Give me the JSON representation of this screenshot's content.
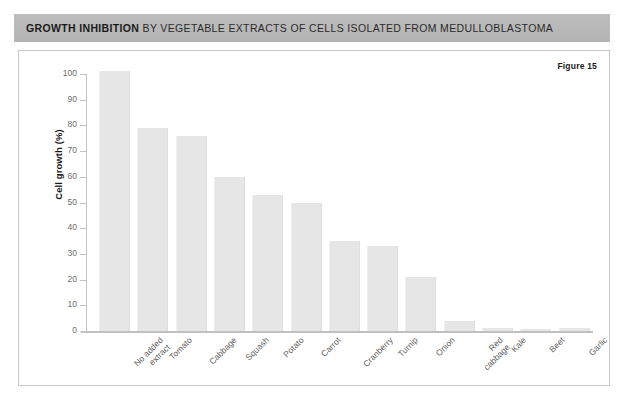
{
  "header": {
    "title_strong": "GROWTH INHIBITION",
    "title_rest": " BY VEGETABLE EXTRACTS OF CELLS ISOLATED FROM MEDULLOBLASTOMA"
  },
  "figure_label": "Figure 15",
  "colors": {
    "header_bg": "#b9b9b9",
    "bar_fill": "#e6e6e6",
    "axis": "#c4c4c4",
    "tick_text": "#6d6d6d",
    "panel_border": "#c8c8c8"
  },
  "chart_data": {
    "type": "bar",
    "title": "GROWTH INHIBITION BY VEGETABLE EXTRACTS OF CELLS ISOLATED FROM MEDULLOBLASTOMA",
    "xlabel": "",
    "ylabel": "Cell growth (%)",
    "ylim": [
      0,
      100
    ],
    "yticks": [
      0,
      10,
      20,
      30,
      40,
      50,
      60,
      70,
      80,
      90,
      100
    ],
    "grid": false,
    "legend": null,
    "annotations": [
      "Figure 15"
    ],
    "categories": [
      "No added\nextract",
      "Tomato",
      "Cabbage",
      "Squash",
      "Potato",
      "Carrot",
      "Cranberry",
      "Turnip",
      "Onion",
      "Red\ncabbage",
      "Kale",
      "Beet",
      "Garlic"
    ],
    "values": [
      101,
      79,
      76,
      60,
      53,
      50,
      35,
      33,
      21,
      4,
      1.2,
      0.6,
      1.2
    ]
  }
}
